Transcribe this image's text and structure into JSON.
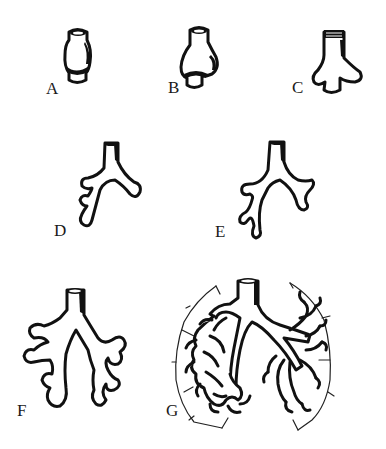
{
  "diagram": {
    "background": "#ffffff",
    "ink_color": "#111111",
    "panels": [
      {
        "id": "A",
        "label": "A",
        "description": "tubular foregut with ventral bulge"
      },
      {
        "id": "B",
        "label": "B",
        "description": "lung bud outpouching"
      },
      {
        "id": "C",
        "label": "C",
        "description": "bifurcation into two bronchial buds"
      },
      {
        "id": "D",
        "label": "D",
        "description": "primary bronchi with early secondary buds"
      },
      {
        "id": "E",
        "label": "E",
        "description": "lobar branching"
      },
      {
        "id": "F",
        "label": "F",
        "description": "segmental branching"
      },
      {
        "id": "G",
        "label": "G",
        "description": "mature bronchial tree within lung outline"
      }
    ]
  }
}
